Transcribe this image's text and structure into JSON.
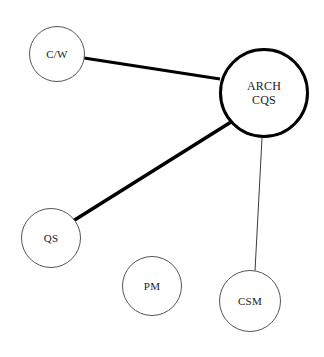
{
  "diagram": {
    "type": "node-link-network",
    "background_color": "#ffffff",
    "canvas": {
      "width": 324,
      "height": 357
    },
    "nodes": [
      {
        "id": "cw",
        "label": "C/W",
        "cx": 57,
        "cy": 54,
        "r": 28,
        "stroke_color": "#555555",
        "stroke_width": 1,
        "fill_color": "#ffffff",
        "font_size": 11,
        "emphasis": "normal"
      },
      {
        "id": "arch_cqs",
        "label": "ARCH\nCQS",
        "cx": 264,
        "cy": 93,
        "r": 45,
        "stroke_color": "#000000",
        "stroke_width": 3,
        "fill_color": "#ffffff",
        "font_size": 12,
        "emphasis": "bold-outline"
      },
      {
        "id": "qs",
        "label": "QS",
        "cx": 51,
        "cy": 238,
        "r": 30,
        "stroke_color": "#555555",
        "stroke_width": 1,
        "fill_color": "#ffffff",
        "font_size": 11,
        "emphasis": "normal"
      },
      {
        "id": "pm",
        "label": "PM",
        "cx": 152,
        "cy": 286,
        "r": 30,
        "stroke_color": "#555555",
        "stroke_width": 1,
        "fill_color": "#ffffff",
        "font_size": 11,
        "emphasis": "normal"
      },
      {
        "id": "csm",
        "label": "CSM",
        "cx": 250,
        "cy": 301,
        "r": 31,
        "stroke_color": "#555555",
        "stroke_width": 1,
        "fill_color": "#ffffff",
        "font_size": 11,
        "emphasis": "normal"
      }
    ],
    "edges": [
      {
        "id": "edge-cw-arch",
        "source": "cw",
        "target": "arch_cqs",
        "x1": 84,
        "y1": 58,
        "x2": 220,
        "y2": 79,
        "stroke_color": "#000000",
        "stroke_width": 3,
        "weight": "heavy"
      },
      {
        "id": "edge-qs-arch",
        "source": "qs",
        "target": "arch_cqs",
        "x1": 73,
        "y1": 221,
        "x2": 231,
        "y2": 122,
        "stroke_color": "#000000",
        "stroke_width": 3.5,
        "weight": "heavy"
      },
      {
        "id": "edge-arch-csm",
        "source": "arch_cqs",
        "target": "csm",
        "x1": 262,
        "y1": 138,
        "x2": 255,
        "y2": 271,
        "stroke_color": "#3a3a3a",
        "stroke_width": 1,
        "weight": "light"
      }
    ]
  }
}
